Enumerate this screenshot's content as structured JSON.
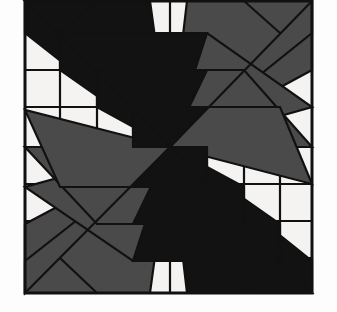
{
  "figure": {
    "title": "Rotationally symmetric four-quadrant pinwheel sunburst block",
    "type": "geometric-line-art",
    "canvas": {
      "width": 337,
      "height": 312
    },
    "frame": {
      "x": 25,
      "y": 1,
      "width": 287,
      "height": 292,
      "stroke_width": 3
    },
    "center": {
      "x": 170,
      "y": 147
    },
    "colors": {
      "page_background": "#fdfdfd",
      "panel_background": "#f4f3f1",
      "black_fill": "#121212",
      "gray_fill": "#4a4a4a",
      "stroke": "#111111"
    },
    "quadrants": [
      {
        "name": "top-left",
        "fill": "black",
        "spike_count": 4,
        "orientation": "radiating-up-left"
      },
      {
        "name": "top-right",
        "fill": "gray",
        "spike_count": 4,
        "orientation": "radiating-up-right"
      },
      {
        "name": "bottom-left",
        "fill": "gray",
        "spike_count": 4,
        "orientation": "radiating-down-left"
      },
      {
        "name": "bottom-right",
        "fill": "black",
        "spike_count": 4,
        "orientation": "radiating-down-right"
      }
    ],
    "grid": {
      "vertical_steps_left": [
        60,
        97,
        133
      ],
      "vertical_steps_right": [
        207,
        244,
        280
      ],
      "horizontal_steps_top": [
        33,
        70,
        107
      ],
      "horizontal_steps_bottom": [
        184,
        221,
        258
      ],
      "mid_horizontal": 147,
      "mid_vertical": 170
    },
    "black_polygons": [
      "170,147 25,1 90,1",
      "170,147 25,33 25,1 150,1",
      "170,147 60,70 60,33 207,33",
      "170,147 97,107 97,70 207,70",
      "170,147 133,147 133,107 207,107",
      "170,147 312,293 247,293",
      "170,147 312,261 312,293 187,293",
      "170,147 280,224 280,261 133,261",
      "170,147 244,187 244,224 133,224",
      "170,147 207,147 207,187 133,187"
    ],
    "gray_polygons": [
      "170,147 312,1 312,70",
      "170,147 187,1 312,1 312,33",
      "170,147 170,33 207,33 312,107",
      "170,147 170,70 244,70 312,147",
      "170,147 170,107 280,107 312,184",
      "170,147 25,293 25,224",
      "170,147 150,293 25,293 25,261",
      "170,147 170,261 133,261 25,187",
      "170,147 170,224 97,224 25,147",
      "170,147 170,187 60,187 25,110"
    ],
    "grid_lines": [
      "25,147 312,147",
      "170,1 170,293",
      "60,147 60,293",
      "97,147 97,293",
      "133,147 133,293",
      "60,1 60,147",
      "97,1 97,147",
      "133,1 133,147",
      "207,1 207,147",
      "244,1 244,147",
      "280,1 280,147",
      "207,147 207,293",
      "244,147 244,293",
      "280,147 280,293",
      "25,33 170,33",
      "25,70 170,70",
      "25,107 170,107",
      "170,33 312,33",
      "170,70 312,70",
      "170,107 312,107",
      "25,184 312,184",
      "25,221 312,221",
      "25,258 312,258"
    ],
    "diagonal_accents": [
      "25,1 170,147",
      "312,1 170,147",
      "25,293 170,147",
      "312,293 170,147",
      "60,258 97,293",
      "244,1 280,33",
      "280,261 244,293",
      "60,33 97,1"
    ]
  }
}
